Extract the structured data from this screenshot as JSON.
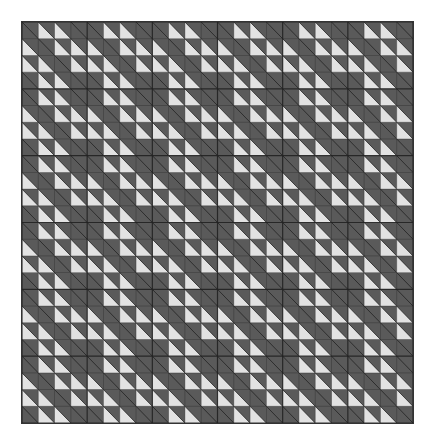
{
  "quilt": {
    "title": "",
    "blocks_x": 6,
    "blocks_y": 6,
    "cells_per_block": 4,
    "block_pattern": [
      [
        "D",
        "L",
        "L",
        "D"
      ],
      [
        "L",
        "D",
        "L",
        "L"
      ],
      [
        "L",
        "L",
        "D",
        "L"
      ],
      [
        "D",
        "L",
        "L",
        "D"
      ]
    ],
    "legend": {
      "D": "dark half-square triangle cell (both halves dark)",
      "L": "lower-left half light, upper-right half dark (diagonal top-left to bottom-right)"
    },
    "colors": {
      "dark": "#5a5a5a",
      "light": "#e2e2e2",
      "line": "#222222",
      "background": "#ffffff"
    }
  }
}
